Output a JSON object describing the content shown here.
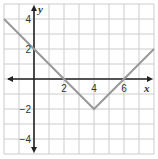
{
  "chart_data": {
    "type": "line",
    "title": "",
    "xlabel": "x",
    "ylabel": "y",
    "xlim": [
      -2,
      8
    ],
    "ylim": [
      -5,
      5
    ],
    "grid": true,
    "x_tick_labels": [
      "2",
      "4",
      "6"
    ],
    "x_tick_values": [
      2,
      4,
      6
    ],
    "y_tick_labels": [
      "4",
      "2",
      "−2",
      "−4"
    ],
    "y_tick_values": [
      4,
      2,
      -2,
      -4
    ],
    "series": [
      {
        "name": "y = |x - 4| - 2",
        "x": [
          -2,
          4,
          8
        ],
        "y": [
          4,
          -2,
          2
        ],
        "color": "#999999"
      }
    ]
  },
  "style": {
    "grid_color": "#cccccc",
    "axis_color": "#222222",
    "line_color": "#999999"
  }
}
